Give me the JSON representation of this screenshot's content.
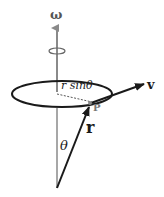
{
  "diagram": {
    "labels": {
      "omega": "ω",
      "velocity": "v",
      "point": "P",
      "radius_vector": "r",
      "angle": "θ",
      "perpendicular_distance": "r sinθ"
    },
    "colors": {
      "axis": "#8a8a8a",
      "vectors": "#1a1a1a",
      "ellipse": "#1a1a1a",
      "point": "#888888"
    }
  }
}
